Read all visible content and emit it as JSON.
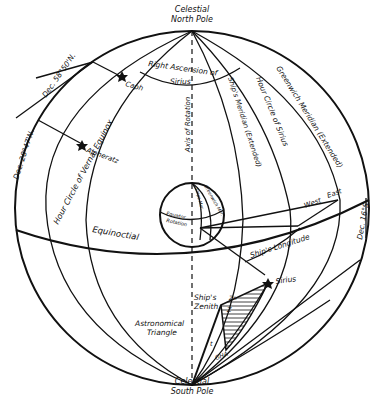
{
  "diagram": {
    "poles": {
      "north": [
        "Celestial",
        "North Pole"
      ],
      "south": [
        "Celestial",
        "South Pole"
      ]
    },
    "great_circles": {
      "equinoctial": "Equinoctial",
      "hour_circle_vernal_equinox": "Hour Circle of Vernal Equinox",
      "ships_meridian": "Ship's Meridian (Extended)",
      "hour_circle_sirius": "Hour Circle of Sirius",
      "greenwich_meridian": "Greenwich Meridian (Extended)"
    },
    "axis": "Axis of Rotation",
    "right_ascension": [
      "Right Ascension of",
      "Sirius"
    ],
    "stars": {
      "caph": "Caph",
      "alpheratz": "Alpheratz",
      "sirius": "Sirius"
    },
    "declinations": {
      "caph": "Dec. 58°50'N.",
      "alpheratz": "Dec. 28°47'N.",
      "sirius": "Dec. 16°S"
    },
    "earth": {
      "equator": [
        "Equator",
        "Rotation"
      ],
      "ships_meridian": "Ships Mer.",
      "greenwich_meridian": "Greenwich Mer."
    },
    "longitude": {
      "label": "Ship's Longitude",
      "west": "West",
      "east": "East"
    },
    "triangle": {
      "zenith": [
        "Ship's",
        "Zenith"
      ],
      "label": [
        "Astronomical",
        "Triangle"
      ],
      "angle_z": "Z",
      "angle_zn": "Zn",
      "angle_t": "t",
      "gha": "GHA"
    }
  }
}
